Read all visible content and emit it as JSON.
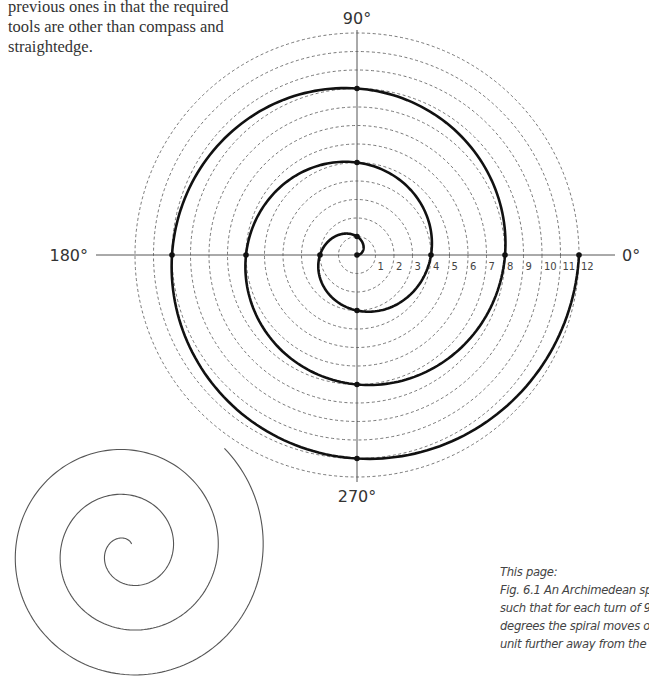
{
  "intro_text": {
    "lines": [
      "previous ones in that the required",
      "tools are other than compass and",
      "straightedge."
    ]
  },
  "figure": {
    "axis_labels": {
      "deg_90": "90°",
      "deg_180": "180°",
      "deg_270": "270°",
      "deg_0": "0°"
    },
    "tick_labels": [
      "1",
      "2",
      "3",
      "4",
      "5",
      "6",
      "7",
      "8",
      "9",
      "10",
      "11",
      "12"
    ],
    "center": [
      357,
      255
    ],
    "unit_px": 18.5,
    "circle_count": 12,
    "spiral_points_units": [
      1,
      2,
      3,
      4,
      5,
      6,
      7,
      8,
      9,
      10,
      11,
      12
    ],
    "colors": {
      "spiral": "#111111",
      "axis": "#555555",
      "circle": "#555555",
      "small_spiral": "#555555"
    }
  },
  "caption": {
    "heading": "This page:",
    "lines": [
      "Fig. 6.1 An Archimedean spiral",
      "such that for each turn of 90",
      "degrees the spiral moves one",
      "unit further away from the pole."
    ]
  }
}
